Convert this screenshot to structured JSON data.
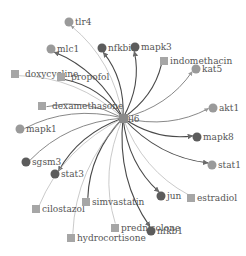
{
  "colors": {
    "gene_light": "#9a9a9a",
    "gene_dark": "#5c5c5c",
    "drug": "#a6a6a6",
    "edge_dark": "#4a4a4a",
    "edge_mid": "#7a7a7a",
    "edge_light": "#b3b3b3"
  },
  "hub": {
    "id": "il6",
    "label": "il6",
    "shape": "square"
  },
  "nodes": [
    {
      "id": "tlr4",
      "label": "tlr4",
      "shape": "circle",
      "tone": "light",
      "edge": "light",
      "dir": "to-node"
    },
    {
      "id": "mlc1",
      "label": "mlc1",
      "shape": "circle",
      "tone": "light",
      "edge": "dark",
      "dir": "to-node"
    },
    {
      "id": "nfkbia",
      "label": "nfkbia",
      "shape": "circle",
      "tone": "dark",
      "edge": "dark",
      "dir": "to-node"
    },
    {
      "id": "mapk3",
      "label": "mapk3",
      "shape": "circle",
      "tone": "dark",
      "edge": "dark",
      "dir": "to-node"
    },
    {
      "id": "indomethacin",
      "label": "indomethacin",
      "shape": "square",
      "tone": "drug",
      "edge": "dark",
      "dir": "none"
    },
    {
      "id": "kat5",
      "label": "kat5",
      "shape": "circle",
      "tone": "light",
      "edge": "mid",
      "dir": "to-node"
    },
    {
      "id": "doxycycline",
      "label": "doxycycline",
      "shape": "square",
      "tone": "drug",
      "edge": "light",
      "dir": "none"
    },
    {
      "id": "propofol",
      "label": "propofol",
      "shape": "square",
      "tone": "drug",
      "edge": "dark",
      "dir": "none"
    },
    {
      "id": "dexamethasone",
      "label": "dexamethasone",
      "shape": "square",
      "tone": "drug",
      "edge": "mid",
      "dir": "none"
    },
    {
      "id": "akt1",
      "label": "akt1",
      "shape": "circle",
      "tone": "light",
      "edge": "mid",
      "dir": "to-node"
    },
    {
      "id": "mapk1",
      "label": "mapk1",
      "shape": "circle",
      "tone": "light",
      "edge": "mid",
      "dir": "from-node"
    },
    {
      "id": "mapk8",
      "label": "mapk8",
      "shape": "circle",
      "tone": "dark",
      "edge": "dark",
      "dir": "to-node"
    },
    {
      "id": "sgsm3",
      "label": "sgsm3",
      "shape": "circle",
      "tone": "dark",
      "edge": "mid",
      "dir": "none"
    },
    {
      "id": "stat3",
      "label": "stat3",
      "shape": "circle",
      "tone": "dark",
      "edge": "dark",
      "dir": "to-node"
    },
    {
      "id": "stat1",
      "label": "stat1",
      "shape": "circle",
      "tone": "light",
      "edge": "dark",
      "dir": "to-node"
    },
    {
      "id": "cilostazol",
      "label": "cilostazol",
      "shape": "square",
      "tone": "drug",
      "edge": "light",
      "dir": "none"
    },
    {
      "id": "simvastatin",
      "label": "simvastatin",
      "shape": "square",
      "tone": "drug",
      "edge": "dark",
      "dir": "none"
    },
    {
      "id": "jun",
      "label": "jun",
      "shape": "circle",
      "tone": "dark",
      "edge": "dark",
      "dir": "to-node"
    },
    {
      "id": "estradiol",
      "label": "estradiol",
      "shape": "square",
      "tone": "drug",
      "edge": "light",
      "dir": "none"
    },
    {
      "id": "prednisolone",
      "label": "prednisolone",
      "shape": "square",
      "tone": "drug",
      "edge": "light",
      "dir": "none"
    },
    {
      "id": "nfkb1",
      "label": "nfkb1",
      "shape": "circle",
      "tone": "dark",
      "edge": "dark",
      "dir": "to-node"
    },
    {
      "id": "hydrocortisone",
      "label": "hydrocortisone",
      "shape": "square",
      "tone": "drug",
      "edge": "light",
      "dir": "none"
    }
  ]
}
